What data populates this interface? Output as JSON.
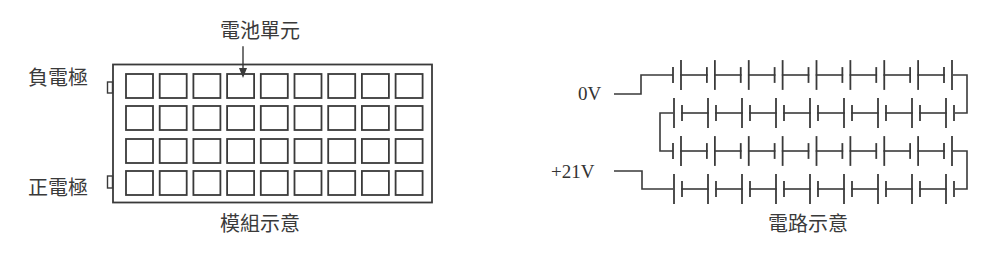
{
  "module": {
    "title": "模組示意",
    "cell_label": "電池單元",
    "negative_label": "負電極",
    "positive_label": "正電極",
    "grid": {
      "rows": 4,
      "cols": 9
    }
  },
  "circuit": {
    "title": "電路示意",
    "low_voltage_label": "0V",
    "high_voltage_label": "+21V",
    "rows": 4,
    "cells_per_row": 9
  },
  "colors": {
    "stroke": "#3a3a3a",
    "background": "#ffffff"
  }
}
